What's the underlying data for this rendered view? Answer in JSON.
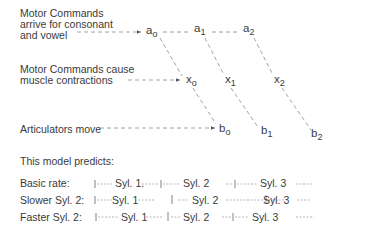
{
  "labels": {
    "commands_arrive": [
      "Motor Commands",
      "arrive for consonant",
      "and vowel"
    ],
    "commands_cause": [
      "Motor Commands cause",
      "muscle contractions"
    ],
    "articulators": "Articulators move",
    "predicts": "This model predicts:"
  },
  "nodes": {
    "a": [
      {
        "base": "a",
        "sub": "o"
      },
      {
        "base": "a",
        "sub": "1"
      },
      {
        "base": "a",
        "sub": "2"
      }
    ],
    "x": [
      {
        "base": "x",
        "sub": "o"
      },
      {
        "base": "x",
        "sub": "1"
      },
      {
        "base": "x",
        "sub": "2"
      }
    ],
    "b": [
      {
        "base": "b",
        "sub": "o"
      },
      {
        "base": "b",
        "sub": "1"
      },
      {
        "base": "b",
        "sub": "2"
      }
    ]
  },
  "rows": [
    {
      "label": "Basic rate:",
      "syl1": "Syl. 1.",
      "syl2": "Syl. 2",
      "syl3": "Syl. 3"
    },
    {
      "label": "Slower Syl. 2:",
      "syl1": "Syl. 1",
      "syl2": "Syl. 2",
      "syl3": "Syl. 3"
    },
    {
      "label": "Faster Syl. 2:",
      "syl1": "Syl. 1",
      "syl2": "Syl. 2",
      "syl3": "Syl. 3"
    }
  ],
  "colors": {
    "text": "#3a3a3a",
    "dash": "#8a8a8a"
  }
}
